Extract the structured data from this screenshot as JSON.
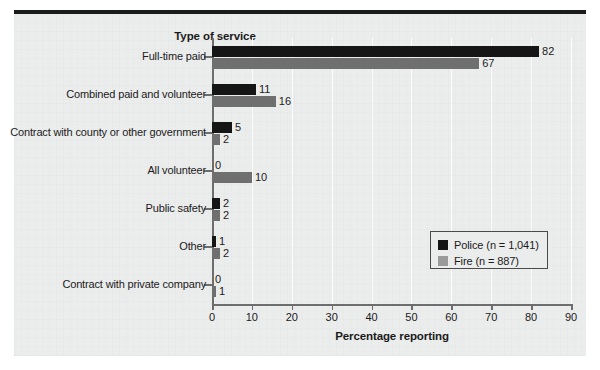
{
  "figure": {
    "background_color": "#ebecec",
    "rule_color": "#1b1b1b"
  },
  "chart_data": {
    "type": "bar",
    "orientation": "horizontal",
    "title": "Type of service",
    "xlabel": "Percentage reporting",
    "ylabel": "",
    "xlim": [
      0,
      90
    ],
    "xticks": [
      "0",
      "10",
      "20",
      "30",
      "40",
      "50",
      "60",
      "70",
      "80",
      "90"
    ],
    "grid": "vertical",
    "legend_position": "center-right",
    "categories": [
      "Full-time paid",
      "Combined paid and volunteer",
      "Contract with county or other government",
      "All volunteer",
      "Public safety",
      "Other",
      "Contract with private company"
    ],
    "series": [
      {
        "name": "Police (n = 1,041)",
        "color": "#151515",
        "values": [
          82,
          11,
          5,
          0,
          2,
          1,
          0
        ]
      },
      {
        "name": "Fire (n = 887)",
        "color": "#6f6f6f",
        "values": [
          67,
          16,
          2,
          10,
          2,
          2,
          1
        ]
      }
    ]
  },
  "legend": {
    "items": [
      {
        "label": "Police (n = 1,041)",
        "color": "#151515"
      },
      {
        "label": "Fire (n = 887)",
        "color": "#9a9a9a"
      }
    ]
  }
}
